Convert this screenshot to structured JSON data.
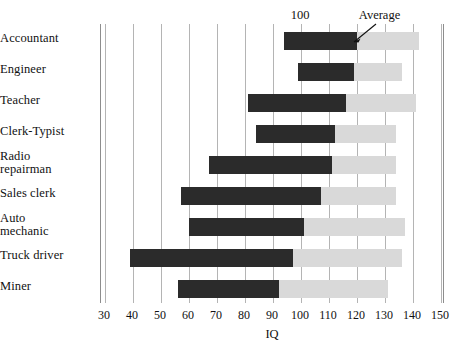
{
  "chart_data": {
    "type": "bar",
    "orientation": "horizontal",
    "title": "",
    "xlabel": "IQ",
    "ylabel": "",
    "xlim": [
      30,
      150
    ],
    "xticks": [
      30,
      40,
      50,
      60,
      70,
      80,
      90,
      100,
      110,
      120,
      130,
      140,
      150
    ],
    "xtick_labels": [
      "30",
      "40",
      "50",
      "60",
      "70",
      "80",
      "90",
      "100",
      "110",
      "120",
      "130",
      "140",
      "150"
    ],
    "grid": true,
    "legend_position": "none",
    "note": "Each occupation shows a dark range bar (typical IQ range) extended by a light bar up to the upper value; the dark/light boundary is annotated as Average.",
    "categories": [
      "Accountant",
      "Engineer",
      "Teacher",
      "Clerk-Typist",
      "Radio repairman",
      "Sales clerk",
      "Auto mechanic",
      "Truck driver",
      "Miner"
    ],
    "series": [
      {
        "name": "Range (dark)",
        "color": "#2b2b2b",
        "start_values": [
          94,
          99,
          81,
          84,
          67,
          57,
          60,
          39,
          56
        ],
        "end_values": [
          120,
          119,
          116,
          112,
          111,
          107,
          101,
          97,
          92
        ]
      },
      {
        "name": "Extended range (light)",
        "color": "#d9d9d9",
        "end_values": [
          142,
          136,
          141,
          134,
          134,
          134,
          137,
          136,
          131
        ]
      }
    ],
    "annotations": [
      {
        "text": "100",
        "at_x": 100,
        "kind": "tick-callout"
      },
      {
        "text": "Average",
        "at_x": 122,
        "kind": "arrow-callout"
      }
    ]
  },
  "categories": [
    {
      "lines": [
        "Accountant"
      ]
    },
    {
      "lines": [
        "Engineer"
      ]
    },
    {
      "lines": [
        "Teacher"
      ]
    },
    {
      "lines": [
        "Clerk-Typist"
      ]
    },
    {
      "lines": [
        "Radio",
        "repairman"
      ]
    },
    {
      "lines": [
        "Sales clerk"
      ]
    },
    {
      "lines": [
        "Auto",
        "mechanic"
      ]
    },
    {
      "lines": [
        "Truck driver"
      ]
    },
    {
      "lines": [
        "Miner"
      ]
    }
  ],
  "axis": {
    "title": "IQ",
    "tick_labels": [
      "30",
      "40",
      "50",
      "60",
      "70",
      "80",
      "90",
      "100",
      "110",
      "120",
      "130",
      "140",
      "150"
    ]
  },
  "annotations": {
    "hundred_label": "100",
    "average_label": "Average"
  },
  "colors": {
    "bar_dark": "#2b2b2b",
    "bar_light": "#d9d9d9",
    "gridline": "#b4b4b4",
    "frame": "#8d8d8d",
    "text": "#111111"
  }
}
